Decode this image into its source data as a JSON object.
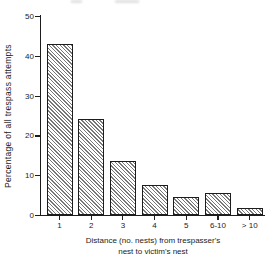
{
  "chart_data": {
    "type": "bar",
    "categories": [
      "1",
      "2",
      "3",
      "4",
      "5",
      "6-10",
      "> 10"
    ],
    "values": [
      43,
      24,
      13.5,
      7.5,
      4.4,
      5.5,
      1.8
    ],
    "title": "",
    "xlabel": "Distance (no. nests) from trespasser's nest to victim's nest",
    "xlabel_lines": [
      "Distance (no. nests) from trespasser's",
      "nest to victim's nest"
    ],
    "ylabel": "Percentage of all trespass attempts",
    "ylim": [
      0,
      50
    ],
    "yticks": [
      0,
      10,
      20,
      30,
      40,
      50
    ],
    "grid": false,
    "legend": null,
    "bar_style": "fine-diagonal-hatch",
    "colors": {
      "background": "#ffffff",
      "axis": "#1c1c1c",
      "text": "#1c1c1c",
      "hatch_line": "#787878"
    }
  }
}
